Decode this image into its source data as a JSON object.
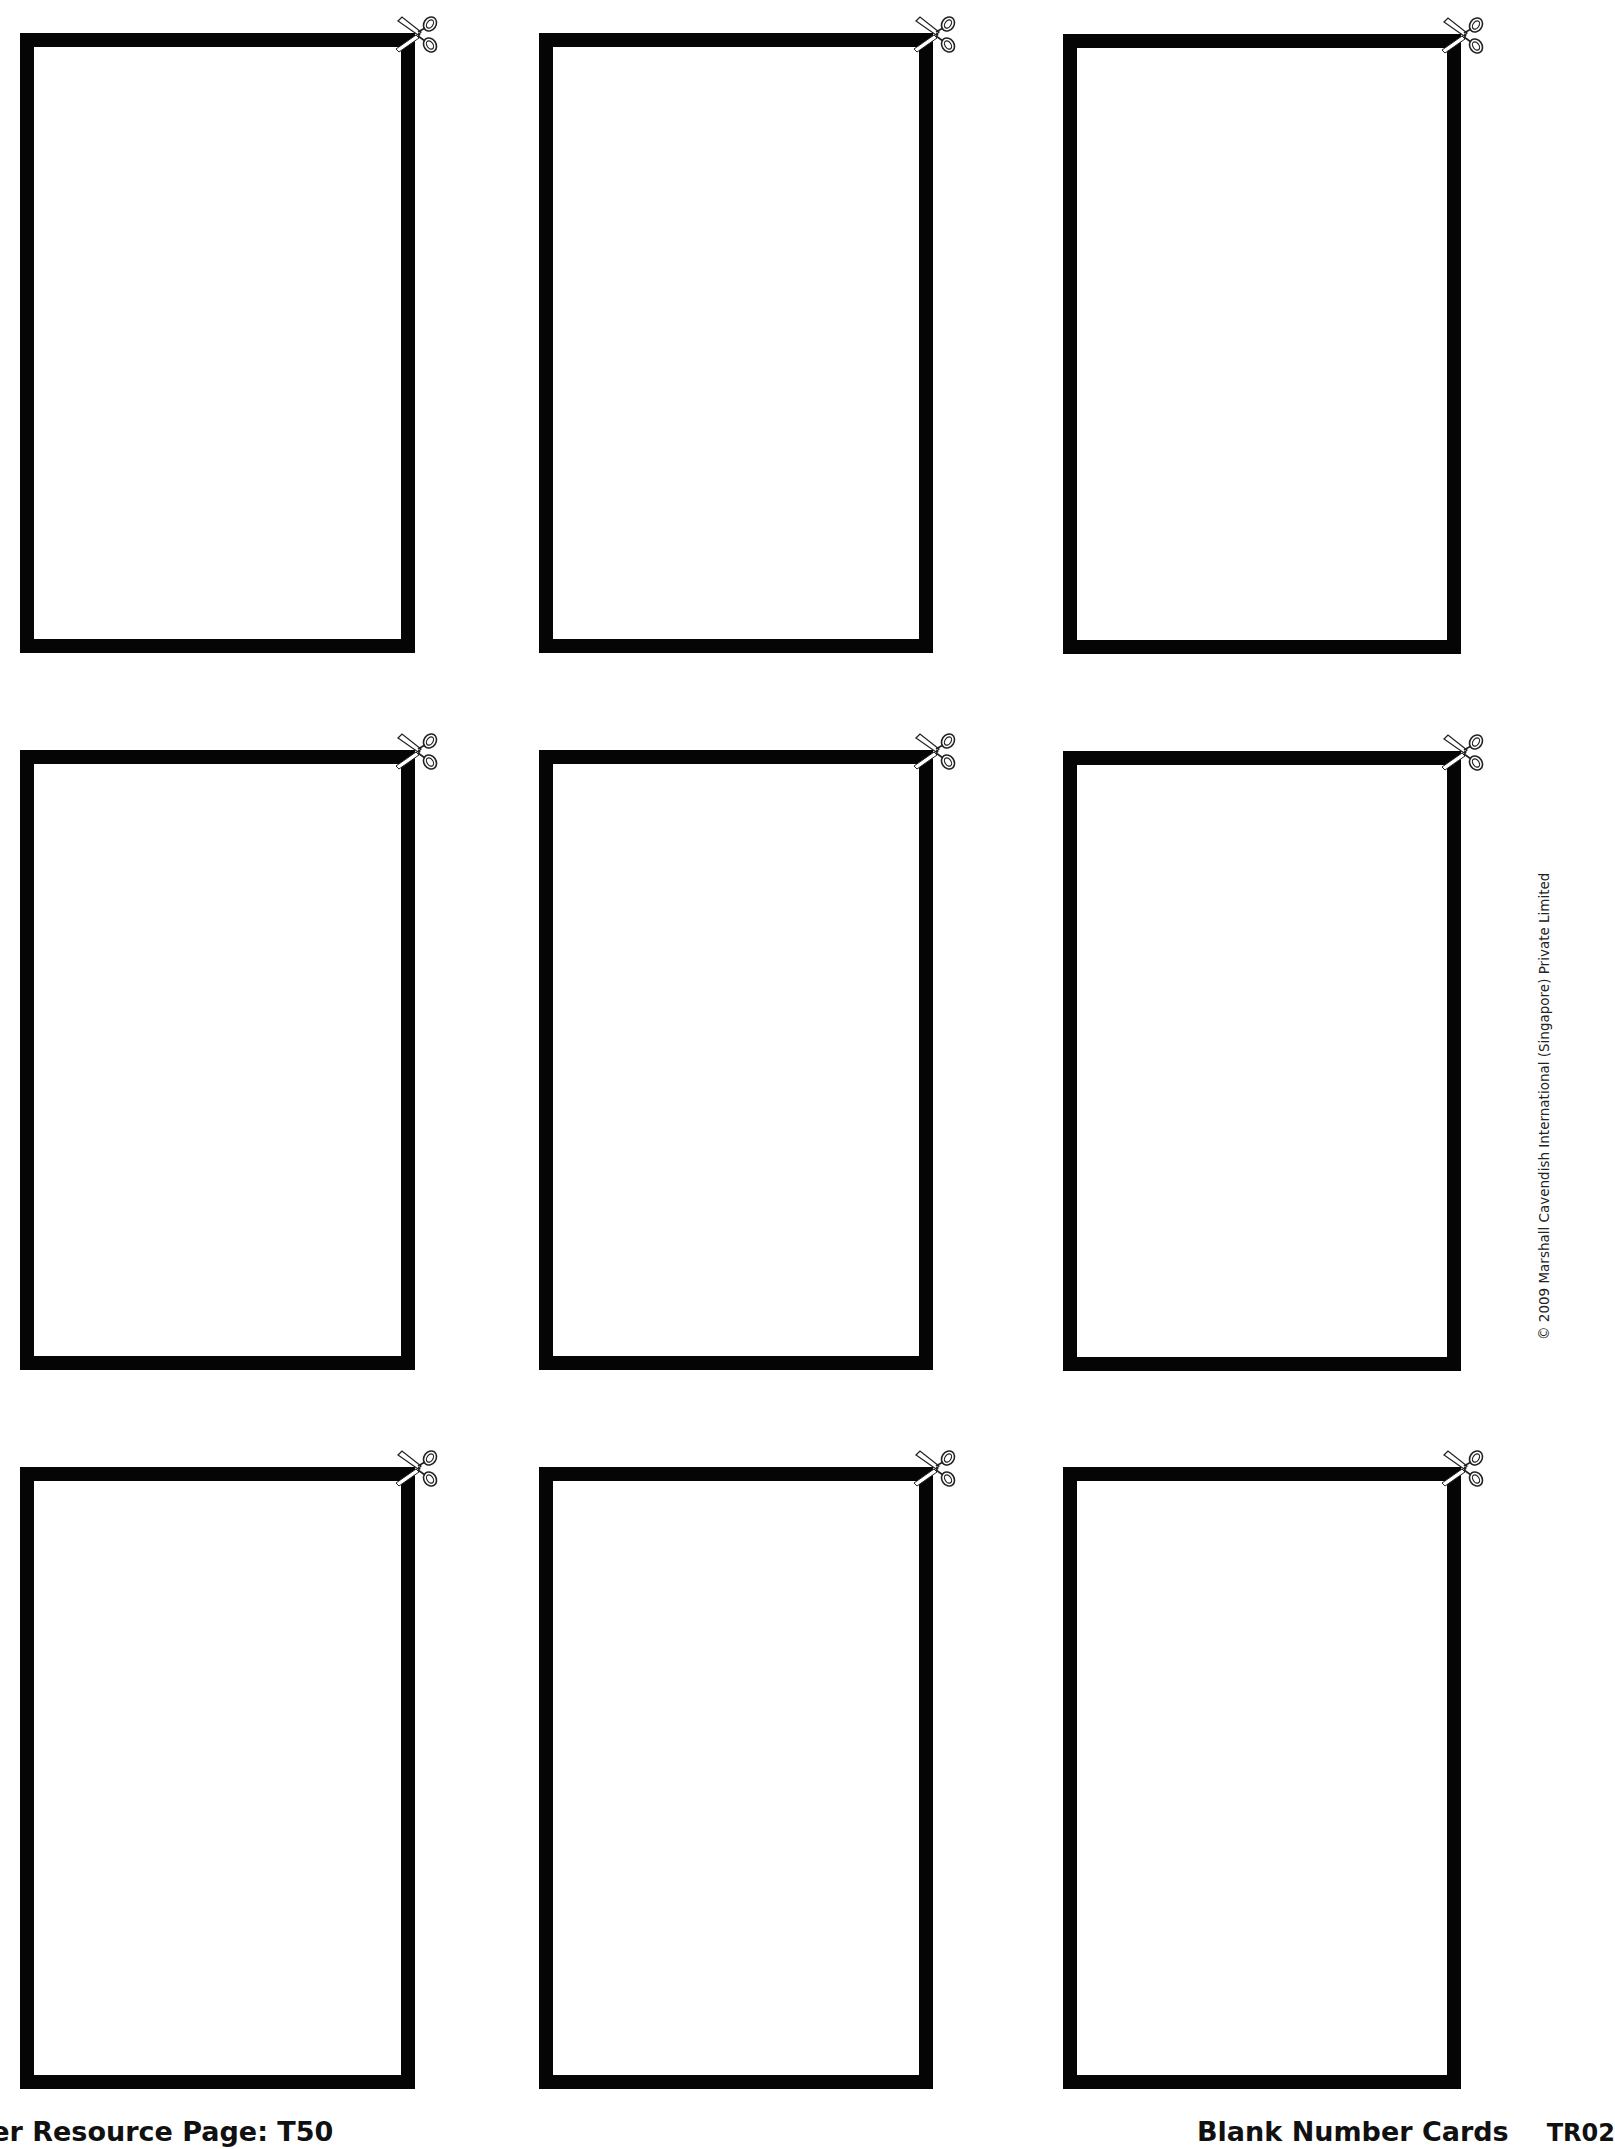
{
  "page": {
    "title": "Blank Number Cards",
    "page_code": "TR02",
    "footer_left": "her Resource Page: T50",
    "copyright": "© 2009 Marshall Cavendish International (Singapore) Private Limited"
  },
  "cards": [
    {
      "row": 1,
      "col": 1,
      "content": ""
    },
    {
      "row": 1,
      "col": 2,
      "content": ""
    },
    {
      "row": 1,
      "col": 3,
      "content": ""
    },
    {
      "row": 2,
      "col": 1,
      "content": ""
    },
    {
      "row": 2,
      "col": 2,
      "content": ""
    },
    {
      "row": 2,
      "col": 3,
      "content": ""
    },
    {
      "row": 3,
      "col": 1,
      "content": ""
    },
    {
      "row": 3,
      "col": 2,
      "content": ""
    },
    {
      "row": 3,
      "col": 3,
      "content": ""
    }
  ],
  "icons": {
    "cut_marker": "scissors-icon"
  },
  "colors": {
    "border": "#050505",
    "background": "#ffffff"
  }
}
